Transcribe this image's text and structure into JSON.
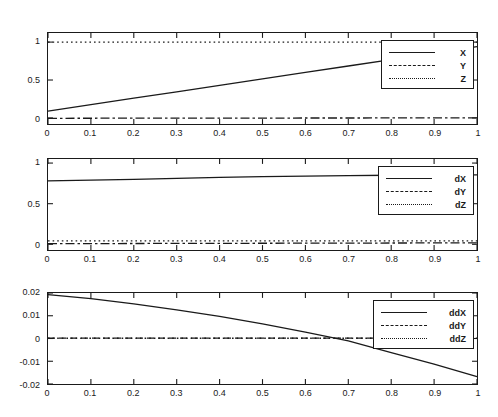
{
  "figure": {
    "background": "#ffffff",
    "axis_color": "#1a1a1a",
    "panel_count": 3
  },
  "chart_data": [
    {
      "type": "line",
      "title": "",
      "xlabel": "",
      "ylabel": "",
      "xlim": [
        0,
        1
      ],
      "ylim": [
        -0.08,
        1.12
      ],
      "grid": false,
      "legend_position": "upper right",
      "xticks": [
        0,
        0.1,
        0.2,
        0.3,
        0.4,
        0.5,
        0.6,
        0.7,
        0.8,
        0.9,
        1
      ],
      "xticklabels": [
        "0",
        "0.1",
        "0.2",
        "0.3",
        "0.4",
        "0.5",
        "0.6",
        "0.7",
        "0.8",
        "0.9",
        "1"
      ],
      "yticks": [
        0,
        0.5,
        1
      ],
      "yticklabels": [
        "0",
        "0.5",
        "1"
      ],
      "x": [
        0,
        0.1,
        0.2,
        0.3,
        0.4,
        0.5,
        0.6,
        0.7,
        0.8,
        0.9,
        1
      ],
      "series": [
        {
          "name": "X",
          "style": "solid",
          "values": [
            0.09,
            0.175,
            0.26,
            0.345,
            0.43,
            0.515,
            0.6,
            0.685,
            0.77,
            0.855,
            0.94
          ]
        },
        {
          "name": "Y",
          "style": "dashdot",
          "values": [
            -0.005,
            -0.004,
            -0.003,
            -0.003,
            -0.002,
            -0.002,
            -0.001,
            -0.001,
            0,
            0,
            0.001
          ]
        },
        {
          "name": "Z",
          "style": "dotted",
          "values": [
            1.0,
            1.0,
            1.0,
            1.0,
            1.0,
            1.0,
            1.0,
            1.0,
            1.0,
            1.0,
            1.0
          ]
        }
      ]
    },
    {
      "type": "line",
      "title": "",
      "xlabel": "",
      "ylabel": "",
      "xlim": [
        0,
        1
      ],
      "ylim": [
        -0.07,
        1.05
      ],
      "grid": false,
      "legend_position": "upper right",
      "xticks": [
        0,
        0.1,
        0.2,
        0.3,
        0.4,
        0.5,
        0.6,
        0.7,
        0.8,
        0.9,
        1
      ],
      "xticklabels": [
        "0",
        "0.1",
        "0.2",
        "0.3",
        "0.4",
        "0.5",
        "0.6",
        "0.7",
        "0.8",
        "0.9",
        "1"
      ],
      "yticks": [
        0,
        0.5,
        1
      ],
      "yticklabels": [
        "0",
        "0.5",
        "1"
      ],
      "x": [
        0,
        0.1,
        0.2,
        0.3,
        0.4,
        0.5,
        0.6,
        0.7,
        0.8,
        0.9,
        1
      ],
      "series": [
        {
          "name": "dX",
          "style": "solid",
          "values": [
            0.78,
            0.79,
            0.8,
            0.812,
            0.823,
            0.832,
            0.84,
            0.846,
            0.85,
            0.853,
            0.855
          ]
        },
        {
          "name": "dY",
          "style": "dashdot",
          "values": [
            0.008,
            0.009,
            0.01,
            0.011,
            0.012,
            0.013,
            0.014,
            0.015,
            0.016,
            0.017,
            0.018
          ]
        },
        {
          "name": "dZ",
          "style": "dotted",
          "values": [
            0.042,
            0.042,
            0.042,
            0.042,
            0.042,
            0.042,
            0.042,
            0.042,
            0.042,
            0.042,
            0.042
          ]
        }
      ]
    },
    {
      "type": "line",
      "title": "",
      "xlabel": "",
      "ylabel": "",
      "xlim": [
        0,
        1
      ],
      "ylim": [
        -0.02,
        0.02
      ],
      "grid": false,
      "legend_position": "upper right",
      "xticks": [
        0,
        0.1,
        0.2,
        0.3,
        0.4,
        0.5,
        0.6,
        0.7,
        0.8,
        0.9,
        1
      ],
      "xticklabels": [
        "0",
        "0.1",
        "0.2",
        "0.3",
        "0.4",
        "0.5",
        "0.6",
        "0.7",
        "0.8",
        "0.9",
        "1"
      ],
      "yticks": [
        -0.02,
        -0.01,
        0,
        0.01,
        0.02
      ],
      "yticklabels": [
        "-0.02",
        "-0.01",
        "0",
        "0.01",
        "0.02"
      ],
      "x": [
        0,
        0.1,
        0.2,
        0.3,
        0.4,
        0.5,
        0.6,
        0.7,
        0.8,
        0.9,
        1
      ],
      "series": [
        {
          "name": "ddX",
          "style": "solid",
          "values": [
            0.0193,
            0.0175,
            0.0152,
            0.0126,
            0.0097,
            0.0064,
            0.0028,
            -0.001,
            -0.0062,
            -0.0113,
            -0.0168
          ]
        },
        {
          "name": "ddY",
          "style": "dashed",
          "values": [
            0.0002,
            0.0002,
            0.0002,
            0.0002,
            0.0002,
            0.0002,
            0.0002,
            0.0002,
            0.0002,
            0.0002,
            0.0002
          ]
        },
        {
          "name": "ddZ",
          "style": "dotted",
          "values": [
            0.0001,
            0.0001,
            0.0001,
            0.0001,
            0.0001,
            0.0001,
            0.0001,
            0.0001,
            0.0001,
            0.0001,
            0.0001
          ]
        }
      ]
    }
  ]
}
